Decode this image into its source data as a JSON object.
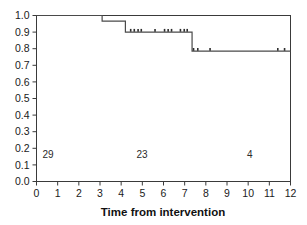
{
  "chart_data": {
    "type": "line",
    "title": "",
    "subtitle": "",
    "xlabel": "Time from intervention",
    "ylabel": "",
    "xlim": [
      0,
      12
    ],
    "ylim": [
      0.0,
      1.0
    ],
    "grid": false,
    "legend": null,
    "x_ticks": [
      "0",
      "1",
      "2",
      "3",
      "4",
      "5",
      "6",
      "7",
      "8",
      "9",
      "10",
      "11",
      "12"
    ],
    "x_tick_values": [
      0,
      1,
      2,
      3,
      4,
      5,
      6,
      7,
      8,
      9,
      10,
      11,
      12
    ],
    "y_ticks": [
      "0.0",
      "0.1",
      "0.2",
      "0.3",
      "0.4",
      "0.5",
      "0.6",
      "0.7",
      "0.8",
      "0.9",
      "1.0"
    ],
    "y_tick_values": [
      0.0,
      0.1,
      0.2,
      0.3,
      0.4,
      0.5,
      0.6,
      0.7,
      0.8,
      0.9,
      1.0
    ],
    "series": [
      {
        "name": "survival",
        "style": "step-post",
        "x": [
          0.0,
          3.1,
          3.1,
          4.2,
          4.2,
          7.35,
          7.35,
          12.0
        ],
        "y": [
          1.0,
          1.0,
          0.966,
          0.966,
          0.9,
          0.9,
          0.785,
          0.785
        ]
      }
    ],
    "censored_points": {
      "name": "censored observations",
      "marker": "tick",
      "x": [
        4.45,
        4.62,
        4.8,
        4.95,
        5.6,
        6.05,
        6.22,
        6.38,
        6.8,
        6.98,
        7.12,
        7.42,
        7.62,
        8.2,
        11.4,
        11.72
      ],
      "y": [
        0.9,
        0.9,
        0.9,
        0.9,
        0.9,
        0.9,
        0.9,
        0.9,
        0.9,
        0.9,
        0.9,
        0.785,
        0.785,
        0.785,
        0.785,
        0.785
      ]
    },
    "at_risk_annotations": [
      {
        "label": "29",
        "x": 0.28,
        "y": 0.142
      },
      {
        "label": "23",
        "x": 4.72,
        "y": 0.142
      },
      {
        "label": "4",
        "x": 9.95,
        "y": 0.142
      }
    ]
  }
}
